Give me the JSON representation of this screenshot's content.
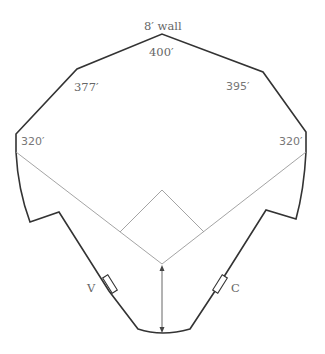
{
  "diagram": {
    "type": "baseball-field-dimensions",
    "labels": {
      "wall_note": "8′ wall",
      "center_field": "400′",
      "left_center": "377′",
      "right_center": "395′",
      "left_field": "320′",
      "right_field": "320′",
      "visitor_dugout": "V",
      "home_dugout": "C"
    },
    "colors": {
      "wall": "#333333",
      "foul_lines": "#9a9a9a",
      "text": "#666666"
    }
  }
}
